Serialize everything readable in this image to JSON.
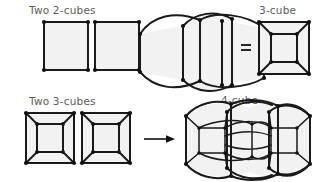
{
  "figure": {
    "title_absent": true,
    "background_color": "#ffffff",
    "ink_color": "#1a1a1a",
    "face_fill_color": "#f2f2f2",
    "label_color": "#5c5c5c"
  },
  "labels": {
    "row1_left": "Two 2-cubes",
    "row1_right": "3-cube",
    "row2_left": "Two 3-cubes",
    "row2_right": "4-cube"
  },
  "operators": {
    "row1_arrow": "arrow-right",
    "row1_equals": "=",
    "row2_arrow": "arrow-right"
  },
  "rows": [
    {
      "name": "row-1",
      "input_label": "Two 2-cubes",
      "input_shape": "two-squares",
      "input_count": 2,
      "middle_shape": "joined-squares-with-arcs",
      "output_label": "3-cube",
      "output_shape": "nested-square-cube",
      "relation": "="
    },
    {
      "name": "row-2",
      "input_label": "Two 3-cubes",
      "input_shape": "two-nested-square-cubes",
      "input_count": 2,
      "output_label": "4-cube",
      "output_shape": "tesseract-joined-arcs",
      "relation": "arrow-right"
    }
  ]
}
